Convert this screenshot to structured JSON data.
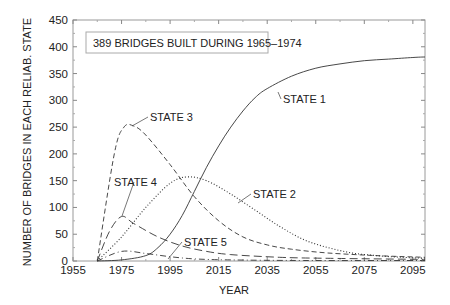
{
  "chart_data": {
    "type": "line",
    "title": "",
    "annotation_box": "389 BRIDGES BUILT DURING 1965–1974",
    "xlabel": "YEAR",
    "ylabel": "NUMBER OF BRIDGES IN EACH RELIAB. STATE",
    "xlim": [
      1955,
      2100
    ],
    "ylim": [
      0,
      450
    ],
    "x_ticks": [
      1955,
      1975,
      1995,
      2015,
      2035,
      2055,
      2075,
      2095
    ],
    "y_ticks": [
      0,
      50,
      100,
      150,
      200,
      250,
      300,
      350,
      400,
      450
    ],
    "grid": false,
    "legend_position": "inline-annotations",
    "series": [
      {
        "name": "STATE 1",
        "style": "solid",
        "x": [
          1965,
          1975,
          1985,
          1990,
          1995,
          2000,
          2005,
          2010,
          2015,
          2020,
          2025,
          2030,
          2035,
          2045,
          2055,
          2065,
          2075,
          2085,
          2095,
          2100
        ],
        "values": [
          0,
          2,
          10,
          25,
          50,
          85,
          130,
          175,
          215,
          250,
          280,
          305,
          322,
          345,
          360,
          368,
          374,
          377,
          380,
          381
        ]
      },
      {
        "name": "STATE 2",
        "style": "dotted",
        "x": [
          1965,
          1975,
          1985,
          1995,
          2002,
          2010,
          2020,
          2030,
          2040,
          2050,
          2060,
          2070,
          2080,
          2090,
          2100
        ],
        "values": [
          0,
          45,
          100,
          145,
          157,
          150,
          125,
          95,
          65,
          40,
          25,
          15,
          10,
          7,
          5
        ]
      },
      {
        "name": "STATE 3",
        "style": "dashed",
        "x": [
          1965,
          1972,
          1976,
          1980,
          1985,
          1995,
          2005,
          2015,
          2025,
          2035,
          2045,
          2060,
          2080,
          2100
        ],
        "values": [
          0,
          200,
          250,
          252,
          235,
          180,
          120,
          75,
          45,
          30,
          22,
          15,
          10,
          7
        ]
      },
      {
        "name": "STATE 4",
        "style": "long-dash",
        "x": [
          1965,
          1970,
          1975,
          1980,
          1990,
          2000,
          2010,
          2020,
          2040,
          2060,
          2100
        ],
        "values": [
          0,
          55,
          83,
          70,
          45,
          28,
          18,
          12,
          7,
          5,
          3
        ]
      },
      {
        "name": "STATE 5",
        "style": "dash-dot",
        "x": [
          1965,
          1975,
          1985,
          1995,
          2005,
          2020,
          2050,
          2100
        ],
        "values": [
          0,
          18,
          14,
          8,
          4,
          2,
          1,
          1
        ]
      }
    ],
    "annotations": [
      {
        "text": "STATE 1",
        "label_x": 283,
        "label_y": 103,
        "arrow_to": [
          278,
          92
        ]
      },
      {
        "text": "STATE 2",
        "label_x": 253,
        "label_y": 198,
        "arrow_to": [
          238,
          203
        ]
      },
      {
        "text": "STATE 3",
        "label_x": 150,
        "label_y": 121,
        "arrow_to": [
          132,
          126
        ]
      },
      {
        "text": "STATE 4",
        "label_x": 114,
        "label_y": 186,
        "arrow_to": [
          122,
          216
        ]
      },
      {
        "text": "STATE 5",
        "label_x": 184,
        "label_y": 246,
        "arrow_to": [
          168,
          259
        ]
      }
    ]
  }
}
